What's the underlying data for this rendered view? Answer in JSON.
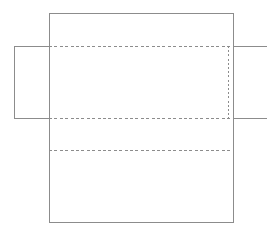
{
  "document": {
    "title": "Box Die-Cut Template",
    "kind": "packaging-net-diagram",
    "canvas": {
      "width": 267,
      "height": 234,
      "background": "#ffffff"
    }
  },
  "style": {
    "cut_line_color": "#8c8c8c",
    "fold_line_color": "#8c8c8c",
    "panel_fill": "#ffffff",
    "cut_line_width": 1.1,
    "fold_line_width": 1,
    "fold_dash_pattern": "3 2.4"
  },
  "geometry": {
    "main_panel": {
      "x": 49,
      "y": 13,
      "width": 184,
      "height": 209
    },
    "left_flap": {
      "x": 14,
      "y": 46,
      "width": 35,
      "height": 72
    },
    "right_flap": {
      "x": 233,
      "y": 46,
      "width": 34,
      "height": 72
    }
  },
  "cut_paths": {
    "main_outline": "M 49 13 L 233 13 L 233 222 L 49 222 Z",
    "left_flap_outline": "M 49 46 L 14 46 L 14 118 L 49 118",
    "right_flap_top_edge": "M 233 46 L 267 46",
    "right_flap_bottom_edge": "M 233 118 L 267 118"
  },
  "fold_lines": [
    {
      "id": "fold-horizontal-top",
      "orientation": "horizontal",
      "x1": 49,
      "y1": 46.5,
      "x2": 233,
      "y2": 46.5
    },
    {
      "id": "fold-horizontal-middle",
      "orientation": "horizontal",
      "x1": 49,
      "y1": 118.5,
      "x2": 233,
      "y2": 118.5
    },
    {
      "id": "fold-horizontal-lower",
      "orientation": "horizontal",
      "x1": 49,
      "y1": 150.5,
      "x2": 233,
      "y2": 150.5
    },
    {
      "id": "fold-vertical-left",
      "orientation": "vertical",
      "x1": 49.5,
      "y1": 46,
      "x2": 49.5,
      "y2": 118
    },
    {
      "id": "fold-vertical-right",
      "orientation": "vertical",
      "x1": 228.5,
      "y1": 46,
      "x2": 228.5,
      "y2": 118
    }
  ],
  "regions": [
    {
      "id": "top-panel",
      "label": "",
      "x": 49,
      "y": 13,
      "width": 184,
      "height": 33
    },
    {
      "id": "center-panel",
      "label": "",
      "x": 49,
      "y": 46,
      "width": 184,
      "height": 72
    },
    {
      "id": "lower-panel",
      "label": "",
      "x": 49,
      "y": 118,
      "width": 184,
      "height": 32
    },
    {
      "id": "bottom-panel",
      "label": "",
      "x": 49,
      "y": 150,
      "width": 184,
      "height": 72
    },
    {
      "id": "left-glue-flap",
      "label": "",
      "x": 14,
      "y": 46,
      "width": 35,
      "height": 72
    },
    {
      "id": "right-glue-flap",
      "label": "",
      "x": 233,
      "y": 46,
      "width": 34,
      "height": 72
    }
  ],
  "labels": []
}
